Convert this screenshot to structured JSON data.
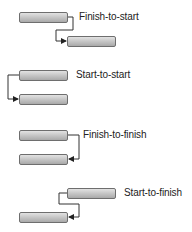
{
  "diagram": {
    "type": "task-dependency-types",
    "colors": {
      "bar_top": "#e2e2e2",
      "bar_bottom": "#a9a9a9",
      "bar_border": "#6e6e6e",
      "connector": "#333333"
    },
    "dependencies": [
      {
        "label": "Finish-to-start",
        "predecessor": {
          "x": 19,
          "y": 12,
          "w": 48
        },
        "successor": {
          "x": 67,
          "y": 36,
          "w": 48
        },
        "label_pos": {
          "x": 79,
          "y": 11
        }
      },
      {
        "label": "Start-to-start",
        "predecessor": {
          "x": 19,
          "y": 70,
          "w": 48
        },
        "successor": {
          "x": 19,
          "y": 94,
          "w": 48
        },
        "label_pos": {
          "x": 76,
          "y": 69
        }
      },
      {
        "label": "Finish-to-finish",
        "predecessor": {
          "x": 19,
          "y": 130,
          "w": 48
        },
        "successor": {
          "x": 19,
          "y": 154,
          "w": 48
        },
        "label_pos": {
          "x": 83,
          "y": 129
        }
      },
      {
        "label": "Start-to-finish",
        "predecessor": {
          "x": 67,
          "y": 188,
          "w": 48
        },
        "successor": {
          "x": 19,
          "y": 212,
          "w": 48
        },
        "label_pos": {
          "x": 124,
          "y": 187
        }
      }
    ]
  }
}
